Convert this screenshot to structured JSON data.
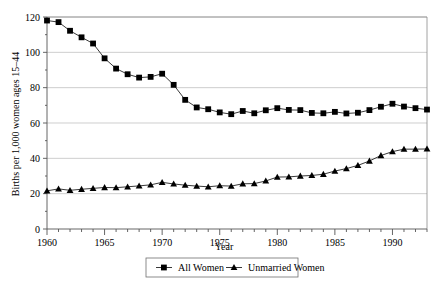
{
  "chart_data": {
    "type": "line",
    "title": "",
    "xlabel": "Year",
    "ylabel": "Births per 1,000 women ages 15–44",
    "xlim": [
      1960,
      1993
    ],
    "ylim": [
      0,
      120
    ],
    "ytick_values": [
      0,
      20,
      40,
      60,
      80,
      100,
      120
    ],
    "ytick_labels": [
      "0",
      "20",
      "40",
      "60",
      "80",
      "100",
      "120"
    ],
    "xtick_major_values": [
      1960,
      1965,
      1970,
      1975,
      1980,
      1985,
      1990
    ],
    "xtick_major_labels": [
      "1960",
      "1965",
      "1970",
      "1975",
      "1980",
      "1985",
      "1990"
    ],
    "xtick_minor_step": 1,
    "grid": "horizontal",
    "legend_position": "bottom-center",
    "x": [
      1960,
      1961,
      1962,
      1963,
      1964,
      1965,
      1966,
      1967,
      1968,
      1969,
      1970,
      1971,
      1972,
      1973,
      1974,
      1975,
      1976,
      1977,
      1978,
      1979,
      1980,
      1981,
      1982,
      1983,
      1984,
      1985,
      1986,
      1987,
      1988,
      1989,
      1990,
      1991,
      1992,
      1993
    ],
    "series": [
      {
        "name": "All Women",
        "marker": "square",
        "values": [
          118.0,
          117.1,
          112.2,
          108.5,
          105.0,
          96.6,
          90.8,
          87.6,
          85.7,
          86.1,
          87.9,
          81.6,
          73.1,
          68.8,
          67.8,
          66.0,
          65.0,
          66.8,
          65.5,
          67.2,
          68.4,
          67.4,
          67.3,
          65.7,
          65.5,
          66.3,
          65.4,
          65.8,
          67.3,
          69.2,
          70.9,
          69.3,
          68.4,
          67.6
        ]
      },
      {
        "name": "Unmarried Women",
        "marker": "triangle",
        "values": [
          21.6,
          22.7,
          21.9,
          22.5,
          23.0,
          23.5,
          23.4,
          23.9,
          24.4,
          25.0,
          26.4,
          25.5,
          24.8,
          24.3,
          23.9,
          24.5,
          24.3,
          25.6,
          25.7,
          27.2,
          29.4,
          29.5,
          30.0,
          30.3,
          31.0,
          32.8,
          34.2,
          36.0,
          38.5,
          41.6,
          43.8,
          45.2,
          45.2,
          45.3
        ]
      }
    ]
  },
  "legend": {
    "items": [
      {
        "label": "All Women",
        "marker": "square"
      },
      {
        "label": "Unmarried Women",
        "marker": "triangle"
      }
    ]
  }
}
